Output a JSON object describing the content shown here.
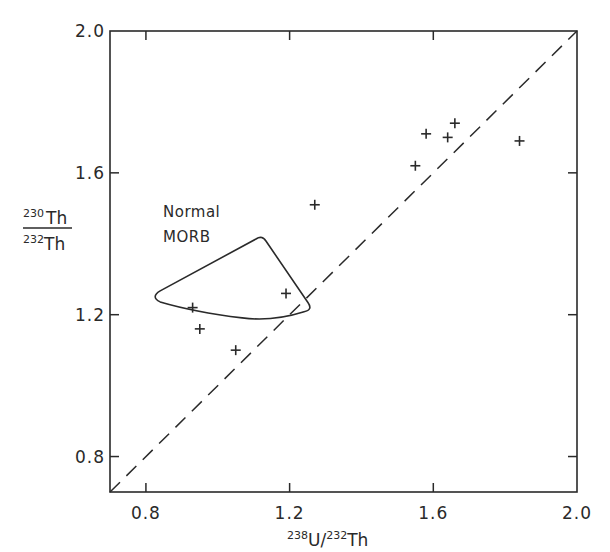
{
  "chart_data": {
    "type": "scatter",
    "title": "",
    "xlabel": "238U/232Th",
    "ylabel": "230Th/232Th",
    "xlabel_parts": {
      "iso1": "238",
      "el1": "U/",
      "iso2": "232",
      "el2": "Th"
    },
    "ylabel_parts": {
      "num_iso": "230",
      "num_el": "Th",
      "den_iso": "232",
      "den_el": "Th"
    },
    "xlim": [
      0.7,
      2.0
    ],
    "ylim": [
      0.7,
      2.0
    ],
    "xticks": [
      0.8,
      1.2,
      1.6,
      2.0
    ],
    "yticks": [
      0.8,
      1.2,
      1.6,
      2.0
    ],
    "xtick_labels": [
      "0.8",
      "1.2",
      "1.6",
      "2.0"
    ],
    "ytick_labels": [
      "0.8",
      "1.2",
      "1.6",
      "2.0"
    ],
    "grid": false,
    "legend": null,
    "series": [
      {
        "name": "samples",
        "marker": "+",
        "points": [
          {
            "x": 0.93,
            "y": 1.22
          },
          {
            "x": 0.95,
            "y": 1.16
          },
          {
            "x": 1.05,
            "y": 1.1
          },
          {
            "x": 1.19,
            "y": 1.26
          },
          {
            "x": 1.27,
            "y": 1.51
          },
          {
            "x": 1.55,
            "y": 1.62
          },
          {
            "x": 1.58,
            "y": 1.71
          },
          {
            "x": 1.64,
            "y": 1.7
          },
          {
            "x": 1.66,
            "y": 1.74
          },
          {
            "x": 1.84,
            "y": 1.69
          }
        ]
      }
    ],
    "reference_lines": [
      {
        "name": "equiline",
        "style": "dashed",
        "from": {
          "x": 0.7,
          "y": 0.7
        },
        "to": {
          "x": 2.0,
          "y": 2.0
        }
      }
    ],
    "regions": [
      {
        "name": "Normal MORB field",
        "label_lines": [
          "Normal",
          "MORB"
        ],
        "label_pos": {
          "x": 0.85,
          "y": 1.54
        },
        "outline": [
          {
            "x": 0.823,
            "y": 1.253
          },
          {
            "x": 1.123,
            "y": 1.419
          },
          {
            "x": 1.257,
            "y": 1.211
          },
          {
            "x": 1.068,
            "y": 1.191
          }
        ]
      }
    ]
  },
  "colors": {
    "ink": "#2a2a2a",
    "background": "#ffffff"
  }
}
